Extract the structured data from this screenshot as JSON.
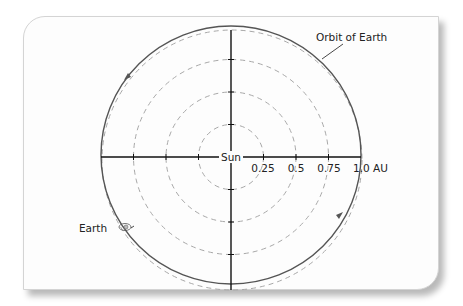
{
  "diagram": {
    "title_label": "Orbit of Earth",
    "center_label": "Sun",
    "body_label": "Earth",
    "scale_labels": [
      "0.25",
      "0.5",
      "0.75",
      "1.0 AU"
    ],
    "scale_values_au": [
      0.25,
      0.5,
      0.75,
      1.0
    ],
    "colors": {
      "orbit": "#555555",
      "reference_circles": "#a8a8a8",
      "axes": "#111111",
      "card_background": "#fdfdfd"
    }
  }
}
